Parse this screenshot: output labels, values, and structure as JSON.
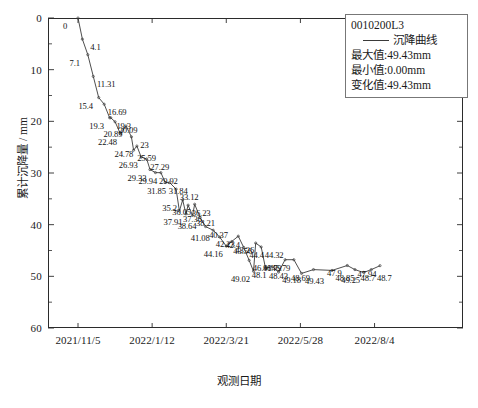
{
  "chart_data": {
    "type": "line",
    "title": "0010200L3",
    "xlabel": "观测日期",
    "ylabel": "累计沉降量 / mm",
    "series_name": "沉降曲线",
    "ylim": [
      0,
      60
    ],
    "y_inverted": true,
    "ytick_labels": [
      "0",
      "10",
      "20",
      "30",
      "40",
      "50",
      "60"
    ],
    "ytick_values": [
      0,
      10,
      20,
      30,
      40,
      50,
      60
    ],
    "minor_ticks": true,
    "grid": false,
    "legend_position": "top-right",
    "xtick_labels": [
      "2021/11/5",
      "2022/1/12",
      "2022/3/21",
      "2022/5/28",
      "2022/8/4"
    ],
    "xtick_positions": [
      0,
      68,
      136,
      204,
      272
    ],
    "line_color": "#3a3a3a",
    "values": [
      0,
      4.1,
      7.1,
      11.31,
      15.4,
      16.69,
      19.3,
      20.09,
      22.48,
      19.3,
      20.89,
      23,
      24.78,
      25.59,
      26.93,
      27.29,
      29.33,
      29.92,
      29.94,
      31.84,
      31.85,
      33.12,
      35.2,
      36.23,
      36.05,
      37.36,
      37.91,
      38.21,
      38.64,
      40.37,
      41.08,
      42.4,
      44.16,
      43.26,
      42.23,
      44.4,
      43.56,
      46.91,
      49.02,
      48.43,
      48.1,
      44.32,
      46.79,
      49.18,
      46.79,
      49.43,
      48.69,
      48.85,
      47.9,
      48.7,
      49.25,
      48.7,
      47.94
    ],
    "x_days": [
      0,
      4,
      9,
      14,
      19,
      24,
      29,
      34,
      39,
      30,
      44,
      49,
      54,
      51,
      58,
      63,
      66,
      71,
      76,
      80,
      84,
      90,
      96,
      101,
      107,
      93,
      99,
      105,
      112,
      117,
      124,
      130,
      136,
      141,
      147,
      152,
      163,
      157,
      161,
      172,
      178,
      168,
      190,
      184,
      198,
      205,
      216,
      233,
      247,
      254,
      262,
      269,
      277
    ],
    "point_labels": [
      "0",
      "4.1",
      "7.1",
      "11.31",
      "15.4",
      "16.69",
      "19.3",
      "20.09",
      "22.48",
      "19.3",
      "20.89",
      "23",
      "24.78",
      "25.59",
      "26.93",
      "27.29",
      "29.33",
      "29.92",
      "29.94",
      "31.84",
      "31.85",
      "33.12",
      "35.2",
      "36.23",
      "36.05",
      "37.36",
      "37.91",
      "38.21",
      "38.64",
      "40.37",
      "41.08",
      "42.4",
      "44.16",
      "43.26",
      "42.23",
      "44.4",
      "43.56",
      "46.91",
      "49.02",
      "48.43",
      "48.1",
      "44.32",
      "46.79",
      "49.18",
      "46.79",
      "49.43",
      "48.69",
      "48.85",
      "47.9",
      "48.7",
      "49.25",
      "48.7",
      "47.94"
    ],
    "legend_lines": [
      "0010200L3",
      "沉降曲线",
      "最大值:49.43mm",
      "最小值:0.00mm",
      "变化值:49.43mm"
    ]
  },
  "caption": ""
}
